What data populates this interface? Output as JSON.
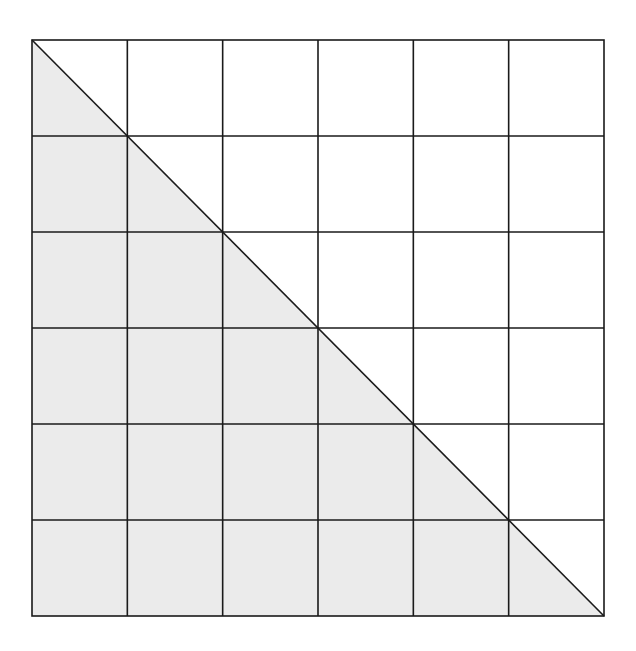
{
  "diagram": {
    "type": "grid-with-shaded-triangle",
    "grid": {
      "rows": 6,
      "cols": 6,
      "left": 32,
      "top": 40,
      "right": 604,
      "bottom": 616,
      "line_color": "#1a1a1a",
      "line_width": 1.6
    },
    "diagonal": {
      "from": "top-left",
      "to": "bottom-right",
      "line_color": "#1a1a1a"
    },
    "shaded_region": {
      "shape": "lower-left triangle",
      "fill": "#ebebeb",
      "vertices": [
        "top-left",
        "bottom-left",
        "bottom-right"
      ]
    },
    "background": "#ffffff"
  }
}
